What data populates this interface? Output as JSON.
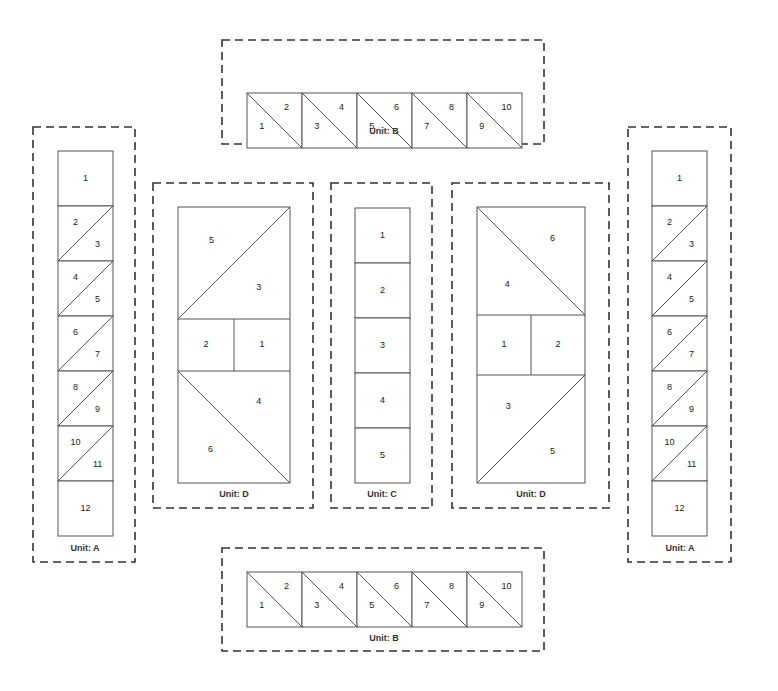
{
  "diagram": {
    "units": [
      {
        "id": "B-top",
        "label": "Unit: B",
        "frame": {
          "x": 222,
          "y": 40,
          "w": 322,
          "h": 104
        },
        "type": "hst-row",
        "origin": {
          "x": 247,
          "y": 93
        },
        "cell": 55,
        "cells": [
          {
            "a": "1",
            "b": "2"
          },
          {
            "a": "3",
            "b": "4"
          },
          {
            "a": "5",
            "b": "6"
          },
          {
            "a": "7",
            "b": "8"
          },
          {
            "a": "9",
            "b": "10"
          }
        ],
        "label_pos": {
          "x": 384,
          "y": 132
        }
      },
      {
        "id": "A-left",
        "label": "Unit: A",
        "frame": {
          "x": 33,
          "y": 127,
          "w": 102,
          "h": 435
        },
        "type": "column-a",
        "origin": {
          "x": 58,
          "y": 151
        },
        "cell": 55,
        "top": "1",
        "hst": [
          {
            "a": "2",
            "b": "3"
          },
          {
            "a": "4",
            "b": "5"
          },
          {
            "a": "6",
            "b": "7"
          },
          {
            "a": "8",
            "b": "9"
          },
          {
            "a": "10",
            "b": "11"
          }
        ],
        "bottom": "12",
        "label_pos": {
          "x": 85,
          "y": 549
        }
      },
      {
        "id": "D-left",
        "label": "Unit: D",
        "frame": {
          "x": 153,
          "y": 183,
          "w": 160,
          "h": 325
        },
        "type": "unit-d",
        "rect": {
          "x": 178,
          "y": 207,
          "w": 112,
          "h": 276
        },
        "mirrored": false,
        "pieces": {
          "top_a": "5",
          "top_b": "3",
          "mid_left": "2",
          "mid_right": "1",
          "bot_a": "4",
          "bot_b": "6"
        },
        "label_pos": {
          "x": 234,
          "y": 495
        }
      },
      {
        "id": "C",
        "label": "Unit: C",
        "frame": {
          "x": 331,
          "y": 183,
          "w": 101,
          "h": 325
        },
        "type": "column-c",
        "origin": {
          "x": 355,
          "y": 208
        },
        "cell": 55,
        "cells": [
          "1",
          "2",
          "3",
          "4",
          "5"
        ],
        "label_pos": {
          "x": 382,
          "y": 495
        }
      },
      {
        "id": "D-right",
        "label": "Unit: D",
        "frame": {
          "x": 452,
          "y": 183,
          "w": 157,
          "h": 325
        },
        "type": "unit-d",
        "rect": {
          "x": 477,
          "y": 207,
          "w": 108,
          "h": 276
        },
        "mirrored": true,
        "pieces": {
          "top_a": "4",
          "top_b": "6",
          "mid_left": "1",
          "mid_right": "2",
          "bot_a": "3",
          "bot_b": "5"
        },
        "label_pos": {
          "x": 531,
          "y": 495
        }
      },
      {
        "id": "A-right",
        "label": "Unit: A",
        "frame": {
          "x": 628,
          "y": 127,
          "w": 103,
          "h": 435
        },
        "type": "column-a",
        "origin": {
          "x": 652,
          "y": 151
        },
        "cell": 55,
        "top": "1",
        "hst": [
          {
            "a": "2",
            "b": "3"
          },
          {
            "a": "4",
            "b": "5"
          },
          {
            "a": "6",
            "b": "7"
          },
          {
            "a": "8",
            "b": "9"
          },
          {
            "a": "10",
            "b": "11"
          }
        ],
        "bottom": "12",
        "label_pos": {
          "x": 680,
          "y": 549
        }
      },
      {
        "id": "B-bottom",
        "label": "Unit: B",
        "frame": {
          "x": 222,
          "y": 548,
          "w": 322,
          "h": 103
        },
        "type": "hst-row",
        "origin": {
          "x": 247,
          "y": 572
        },
        "cell": 55,
        "cells": [
          {
            "a": "1",
            "b": "2"
          },
          {
            "a": "3",
            "b": "4"
          },
          {
            "a": "5",
            "b": "6"
          },
          {
            "a": "7",
            "b": "8"
          },
          {
            "a": "9",
            "b": "10"
          }
        ],
        "label_pos": {
          "x": 384,
          "y": 639
        }
      }
    ]
  }
}
